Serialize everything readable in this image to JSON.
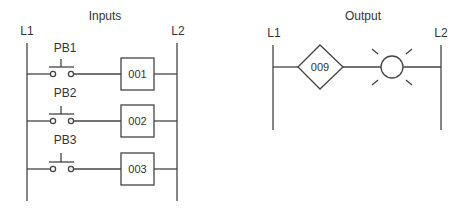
{
  "inputs": {
    "title": "Inputs",
    "left_rail": "L1",
    "right_rail": "L2",
    "rungs": [
      {
        "switch": "PB1",
        "address": "001"
      },
      {
        "switch": "PB2",
        "address": "002"
      },
      {
        "switch": "PB3",
        "address": "003"
      }
    ]
  },
  "output": {
    "title": "Output",
    "left_rail": "L1",
    "right_rail": "L2",
    "instruction": "009",
    "device": "lamp"
  },
  "colors": {
    "line": "#444444",
    "text": "#333333"
  }
}
